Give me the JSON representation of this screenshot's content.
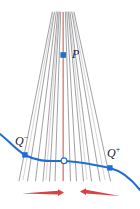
{
  "figure": {
    "type": "geometric-diagram",
    "background_color": "#ffffff",
    "labels": {
      "vertex": "P",
      "left_point_base": "Q",
      "left_point_superscript": "−",
      "right_point_base": "Q",
      "right_point_superscript": "+"
    },
    "colors": {
      "pencil_line": "#6e6e72",
      "axis_line": "#e0726e",
      "curve": "#1f6fd0",
      "marker_fill": "#1f6fd0",
      "hollow_marker_fill": "#ffffff",
      "arrow": "#d92b2b",
      "label_text": "#1a1a1a"
    },
    "vertex_point": {
      "x": 63,
      "y": 55
    },
    "curve_points": {
      "left_marker": {
        "x": 25,
        "y": 155
      },
      "center_marker": {
        "x": 64,
        "y": 161
      },
      "right_marker": {
        "x": 110,
        "y": 168
      }
    },
    "pencil": {
      "count": 13,
      "top_y": 12,
      "bottom_y": 182,
      "bottom_x_spread": [
        18,
        112
      ]
    },
    "arrows": [
      {
        "name": "left-arrow",
        "direction": "right",
        "x1": 22,
        "x2": 64,
        "y": 193
      },
      {
        "name": "right-arrow",
        "direction": "left",
        "x1": 120,
        "x2": 80,
        "y": 193
      }
    ]
  }
}
